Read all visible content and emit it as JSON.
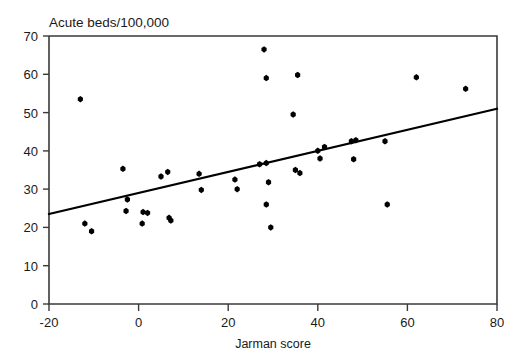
{
  "chart_data": {
    "type": "scatter",
    "title": "",
    "ylabel": "Acute beds/100,000",
    "xlabel": "Jarman score",
    "xlim": [
      -20,
      80
    ],
    "ylim": [
      0,
      70
    ],
    "xticks": [
      -20,
      0,
      20,
      40,
      60,
      80
    ],
    "yticks": [
      0,
      10,
      20,
      30,
      40,
      50,
      60,
      70
    ],
    "xtick_labels": [
      "-20",
      "0",
      "20",
      "40",
      "60",
      "80"
    ],
    "ytick_labels": [
      "0",
      "10",
      "20",
      "30",
      "40",
      "50",
      "60",
      "70"
    ],
    "grid": false,
    "legend": null,
    "marker": "square-diamond",
    "marker_color": "#000000",
    "points": [
      {
        "x": -13.0,
        "y": 53.5
      },
      {
        "x": -12.0,
        "y": 21.0
      },
      {
        "x": -10.5,
        "y": 19.0
      },
      {
        "x": -3.5,
        "y": 35.3
      },
      {
        "x": -2.5,
        "y": 27.3
      },
      {
        "x": -2.8,
        "y": 24.3
      },
      {
        "x": 1.0,
        "y": 24.0
      },
      {
        "x": 2.0,
        "y": 23.8
      },
      {
        "x": 0.8,
        "y": 21.0
      },
      {
        "x": 5.0,
        "y": 33.3
      },
      {
        "x": 6.5,
        "y": 34.5
      },
      {
        "x": 6.8,
        "y": 22.5
      },
      {
        "x": 7.2,
        "y": 21.8
      },
      {
        "x": 14.0,
        "y": 29.8
      },
      {
        "x": 13.5,
        "y": 34.0
      },
      {
        "x": 22.0,
        "y": 30.0
      },
      {
        "x": 21.5,
        "y": 32.5
      },
      {
        "x": 27.0,
        "y": 36.5
      },
      {
        "x": 28.5,
        "y": 36.8
      },
      {
        "x": 28.0,
        "y": 66.5
      },
      {
        "x": 28.5,
        "y": 59.0
      },
      {
        "x": 29.0,
        "y": 31.8
      },
      {
        "x": 28.5,
        "y": 26.0
      },
      {
        "x": 29.5,
        "y": 20.0
      },
      {
        "x": 34.5,
        "y": 49.5
      },
      {
        "x": 35.5,
        "y": 59.8
      },
      {
        "x": 35.0,
        "y": 35.0
      },
      {
        "x": 36.0,
        "y": 34.2
      },
      {
        "x": 40.0,
        "y": 40.0
      },
      {
        "x": 40.5,
        "y": 38.0
      },
      {
        "x": 41.5,
        "y": 41.0
      },
      {
        "x": 47.5,
        "y": 42.5
      },
      {
        "x": 48.5,
        "y": 42.8
      },
      {
        "x": 48.0,
        "y": 37.8
      },
      {
        "x": 55.0,
        "y": 42.5
      },
      {
        "x": 55.5,
        "y": 26.0
      },
      {
        "x": 62.0,
        "y": 59.2
      },
      {
        "x": 73.0,
        "y": 56.2
      }
    ],
    "fit_line": {
      "type": "linear-regression",
      "x_start": -20,
      "y_start": 23.5,
      "x_end": 80,
      "y_end": 51.0
    }
  }
}
